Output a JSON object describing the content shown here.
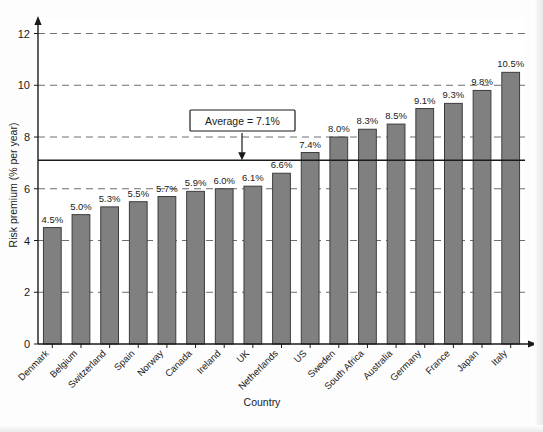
{
  "chart_data": {
    "type": "bar",
    "title": "",
    "xlabel": "Country",
    "ylabel": "Risk premium (% per year)",
    "ylim": [
      0,
      12.6
    ],
    "yticks": [
      0,
      2,
      4,
      6,
      8,
      10,
      12
    ],
    "ytick_labels": [
      "0",
      "2",
      "4",
      "6",
      "8",
      "10",
      "12"
    ],
    "grid": true,
    "grid_style": "dashed-horizontal",
    "legend": "none",
    "categories": [
      "Denmark",
      "Belgium",
      "Switzerland",
      "Spain",
      "Norway",
      "Canada",
      "Ireland",
      "UK",
      "Netherlands",
      "US",
      "Sweden",
      "South Africa",
      "Australia",
      "Germany",
      "France",
      "Japan",
      "Italy"
    ],
    "values": [
      4.5,
      5.0,
      5.3,
      5.5,
      5.7,
      5.9,
      6.0,
      6.1,
      6.6,
      7.4,
      8.0,
      8.3,
      8.5,
      9.1,
      9.3,
      9.8,
      10.5
    ],
    "value_labels": [
      "4.5%",
      "5.0%",
      "5.3%",
      "5.5%",
      "5.7%",
      "5.9%",
      "6.0%",
      "6.1%",
      "6.6%",
      "7.4%",
      "8.0%",
      "8.3%",
      "8.5%",
      "9.1%",
      "9.3%",
      "9.8%",
      "10.5%"
    ],
    "annotations": [
      {
        "name": "average-line",
        "label": "Average = 7.1%",
        "value": 7.1,
        "kind": "horizontal-reference-line-with-callout"
      }
    ],
    "colors": {
      "bar_fill": "#808080",
      "bar_stroke": "#3c3c3c",
      "axis": "#1a1a1a",
      "grid": "#6e6e6e",
      "average_line": "#1a1a1a",
      "plot_background": "#ffffff",
      "figure_background": "#fdfdfd"
    }
  },
  "axis": {
    "y_title": "Risk premium (% per year)",
    "x_title": "Country"
  },
  "annotation_box": {
    "text": "Average = 7.1%"
  }
}
